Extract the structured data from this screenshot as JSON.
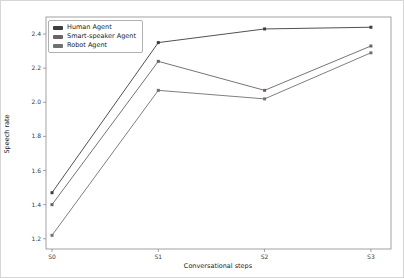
{
  "figure": {
    "background": "#ffffff",
    "border_color": "#d6d6d6"
  },
  "chart_data": {
    "type": "line",
    "title": "",
    "xlabel": "Conversational steps",
    "ylabel": "Speech rate",
    "categories": [
      "S0",
      "S1",
      "S2",
      "S3"
    ],
    "series": [
      {
        "name": "Human Agent",
        "color": "#3d3d3d",
        "values": [
          1.47,
          2.35,
          2.43,
          2.44
        ]
      },
      {
        "name": "Smart-speaker Agent",
        "color": "#6e6161",
        "values": [
          1.4,
          2.24,
          2.07,
          2.33
        ]
      },
      {
        "name": "Robot Agent",
        "color": "#707070",
        "values": [
          1.22,
          2.07,
          2.02,
          2.29
        ]
      }
    ],
    "ylim": [
      1.14,
      2.5
    ],
    "yticks": [
      1.2,
      1.4,
      1.6,
      1.8,
      2.0,
      2.2,
      2.4
    ],
    "grid": false,
    "legend_position": "upper-left",
    "marker": "square",
    "axis_color": "#8a8a8a",
    "tick_label_color": "#3a3a3a"
  }
}
